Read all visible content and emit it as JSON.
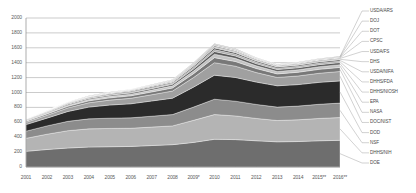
{
  "chart_data": {
    "type": "area",
    "title": "",
    "subtitle": "",
    "xlabel": "",
    "ylabel": "",
    "stacked": true,
    "grid": true,
    "legend_position": "right",
    "xlim": [
      2001,
      2016
    ],
    "ylim": [
      0,
      2000
    ],
    "ytick_values": [
      0,
      200,
      400,
      600,
      800,
      1000,
      1200,
      1400,
      1600,
      1800,
      2000
    ],
    "ytick_labels": [
      "0",
      "200",
      "400",
      "600",
      "800",
      "1000",
      "1200",
      "1400",
      "1600",
      "1800",
      "2000"
    ],
    "x": [
      2001,
      2002,
      2003,
      2004,
      2005,
      2006,
      2007,
      2008,
      2009,
      2010,
      2011,
      2012,
      2013,
      2014,
      2015,
      2016
    ],
    "categories": [
      "2001",
      "2002",
      "2003",
      "2004",
      "2005",
      "2006",
      "2007",
      "2008",
      "2009*",
      "2010",
      "2011",
      "2012",
      "2013",
      "2014",
      "2015**",
      "2016**"
    ],
    "annotations": [
      "2009 marked P (preliminary)",
      "2015 and 2016 marked with double asterisk"
    ],
    "series": [
      {
        "name": "DOE",
        "color": "#6e6e6e",
        "values": [
          210,
          235,
          255,
          268,
          272,
          276,
          288,
          300,
          330,
          372,
          368,
          352,
          338,
          342,
          352,
          358
        ]
      },
      {
        "name": "DHHS/NIH",
        "color": "#b4b4b4",
        "values": [
          175,
          205,
          232,
          244,
          246,
          244,
          248,
          252,
          296,
          332,
          318,
          300,
          286,
          292,
          300,
          306
        ]
      },
      {
        "name": "NSF",
        "color": "#8c8c8c",
        "values": [
          96,
          112,
          126,
          134,
          138,
          140,
          146,
          152,
          178,
          206,
          198,
          188,
          180,
          184,
          190,
          194
        ]
      },
      {
        "name": "DOD",
        "color": "#2b2b2b",
        "values": [
          88,
          104,
          132,
          158,
          176,
          188,
          204,
          220,
          268,
          322,
          318,
          300,
          286,
          288,
          294,
          298
        ]
      },
      {
        "name": "DOC/NIST",
        "color": "#a0a0a0",
        "values": [
          30,
          38,
          48,
          58,
          66,
          74,
          84,
          96,
          128,
          168,
          152,
          128,
          112,
          116,
          122,
          126
        ]
      },
      {
        "name": "NASA",
        "color": "#787878",
        "values": [
          14,
          18,
          22,
          26,
          30,
          33,
          37,
          41,
          52,
          68,
          62,
          54,
          48,
          50,
          53,
          55
        ]
      },
      {
        "name": "EPA",
        "color": "#c4c4c4",
        "values": [
          10,
          12,
          15,
          18,
          20,
          22,
          25,
          28,
          36,
          47,
          43,
          37,
          33,
          34,
          36,
          37
        ]
      },
      {
        "name": "DHHS/NIOSH",
        "color": "#5a5a5a",
        "values": [
          7,
          9,
          11,
          13,
          15,
          17,
          19,
          21,
          27,
          35,
          32,
          28,
          25,
          26,
          27,
          28
        ]
      },
      {
        "name": "DHHS/FDA",
        "color": "#ababab",
        "values": [
          5,
          7,
          8,
          10,
          11,
          13,
          14,
          16,
          21,
          27,
          25,
          21,
          19,
          20,
          21,
          21
        ]
      },
      {
        "name": "USDA/NIFA",
        "color": "#3f3f3f",
        "values": [
          4,
          5,
          6,
          7,
          9,
          10,
          11,
          12,
          16,
          21,
          19,
          16,
          14,
          15,
          16,
          16
        ]
      },
      {
        "name": "DHS",
        "color": "#bdbdbd",
        "values": [
          3,
          4,
          5,
          6,
          7,
          8,
          9,
          10,
          13,
          17,
          15,
          13,
          11,
          12,
          13,
          13
        ]
      },
      {
        "name": "USDA/FS",
        "color": "#6a6a6a",
        "values": [
          2,
          3,
          4,
          4,
          5,
          6,
          7,
          8,
          10,
          13,
          12,
          10,
          9,
          9,
          10,
          10
        ]
      },
      {
        "name": "CPSC",
        "color": "#cfcfcf",
        "values": [
          2,
          2,
          3,
          3,
          4,
          5,
          5,
          6,
          8,
          10,
          9,
          8,
          7,
          7,
          8,
          8
        ]
      },
      {
        "name": "DOT",
        "color": "#4f4f4f",
        "values": [
          1,
          2,
          2,
          3,
          3,
          4,
          4,
          5,
          6,
          8,
          7,
          6,
          5,
          6,
          6,
          6
        ]
      },
      {
        "name": "DOJ",
        "color": "#c9c9c9",
        "values": [
          1,
          1,
          2,
          2,
          2,
          3,
          3,
          4,
          5,
          6,
          6,
          5,
          4,
          4,
          5,
          5
        ]
      },
      {
        "name": "USDA/ARS",
        "color": "#7e7e7e",
        "values": [
          1,
          1,
          1,
          2,
          2,
          2,
          3,
          3,
          4,
          5,
          5,
          4,
          3,
          4,
          4,
          4
        ]
      }
    ],
    "legend_entries": [
      "USDA/ARS",
      "DOJ",
      "DOT",
      "CPSC",
      "USDA/FS",
      "DHS",
      "USDA/NIFA",
      "DHHS/FDA",
      "DHHS/NIOSH",
      "EPA",
      "NASA",
      "DOC/NIST",
      "DOD",
      "NSF",
      "DHHS/NIH",
      "DOE"
    ]
  },
  "axis_colors": {
    "gridline": "#a8a8a8",
    "tick_text": "#5a5a5a",
    "legend_text": "#4a4a4a",
    "leader_line": "#9a9a9a"
  }
}
